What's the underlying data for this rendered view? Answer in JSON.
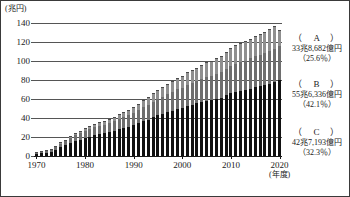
{
  "figure": {
    "y_unit_label": "(兆円)",
    "x_unit_label": "(年度)"
  },
  "legend": [
    {
      "key": "（　A　）",
      "value": "33兆8,682億円",
      "percent": "（25.6％）",
      "top": 10
    },
    {
      "key": "（　B　）",
      "value": "55兆6,336億円",
      "percent": "（42.1％）",
      "top": 56
    },
    {
      "key": "（　C　）",
      "value": "42兆7,193億円",
      "percent": "（32.3％）",
      "top": 104
    }
  ],
  "chart_data": {
    "type": "bar",
    "title": "",
    "subtitle": "",
    "xlabel": "(年度)",
    "ylabel": "(兆円)",
    "ylim": [
      0,
      140
    ],
    "yticks": [
      0,
      20,
      40,
      60,
      80,
      100,
      120,
      140
    ],
    "ytick_labels": [
      "0",
      "20",
      "40",
      "60",
      "80",
      "100",
      "120",
      "140"
    ],
    "grid": true,
    "stacked": true,
    "legend_position": "right",
    "xticks": [
      1970,
      1980,
      1990,
      2000,
      2010,
      2020
    ],
    "xtick_labels": [
      "1970",
      "1980",
      "1990",
      "2000",
      "2010",
      "2020"
    ],
    "x": [
      1970,
      1971,
      1972,
      1973,
      1974,
      1975,
      1976,
      1977,
      1978,
      1979,
      1980,
      1981,
      1982,
      1983,
      1984,
      1985,
      1986,
      1987,
      1988,
      1989,
      1990,
      1991,
      1992,
      1993,
      1994,
      1995,
      1996,
      1997,
      1998,
      1999,
      2000,
      2001,
      2002,
      2003,
      2004,
      2005,
      2006,
      2007,
      2008,
      2009,
      2010,
      2011,
      2012,
      2013,
      2014,
      2015,
      2016,
      2017,
      2018,
      2019,
      2020
    ],
    "series": [
      {
        "name": "C",
        "label": "（　C　）",
        "color": "#111111",
        "values": [
          2.3,
          2.7,
          3.4,
          4.4,
          6.6,
          9.1,
          11.1,
          13.4,
          15.5,
          17.2,
          18.8,
          20.5,
          22.0,
          23.0,
          23.8,
          24.9,
          26.6,
          28.0,
          29.4,
          30.8,
          32.6,
          34.5,
          36.5,
          38.4,
          40.6,
          42.9,
          44.4,
          46.2,
          47.8,
          49.6,
          50.8,
          52.9,
          54.1,
          55.3,
          57.0,
          58.4,
          59.2,
          60.3,
          61.4,
          64.1,
          66.1,
          67.4,
          68.5,
          69.5,
          71.0,
          72.4,
          73.3,
          74.7,
          76.0,
          77.7,
          79.5
        ]
      },
      {
        "name": "B",
        "label": "（　B　）",
        "color": "#6e6e6e",
        "values": [
          1.0,
          1.2,
          1.6,
          2.1,
          2.9,
          3.9,
          4.7,
          5.4,
          6.2,
          6.9,
          7.5,
          8.1,
          8.6,
          9.0,
          9.3,
          9.8,
          10.4,
          11.0,
          11.6,
          12.2,
          13.0,
          13.8,
          14.7,
          15.5,
          16.5,
          17.5,
          18.2,
          19.0,
          19.8,
          20.6,
          21.3,
          22.2,
          22.9,
          23.5,
          24.3,
          25.0,
          25.5,
          26.1,
          26.8,
          28.0,
          29.1,
          29.8,
          30.4,
          31.0,
          31.7,
          32.5,
          33.0,
          33.7,
          34.4,
          35.2,
          36.5
        ]
      },
      {
        "name": "A",
        "label": "（　A　）",
        "color": "#8f8f8f",
        "values": [
          0.2,
          0.3,
          0.4,
          0.6,
          0.9,
          1.3,
          1.6,
          1.9,
          2.3,
          2.6,
          2.9,
          3.2,
          3.5,
          3.7,
          3.9,
          4.2,
          4.6,
          5.0,
          5.4,
          5.8,
          6.3,
          6.9,
          7.5,
          8.1,
          8.8,
          9.5,
          10.0,
          10.6,
          11.2,
          11.8,
          12.4,
          13.1,
          13.7,
          14.2,
          14.8,
          15.4,
          15.8,
          16.3,
          16.9,
          17.8,
          18.6,
          19.2,
          19.7,
          20.2,
          20.8,
          21.4,
          21.8,
          22.4,
          23.0,
          23.7,
          16.2
        ]
      }
    ]
  }
}
